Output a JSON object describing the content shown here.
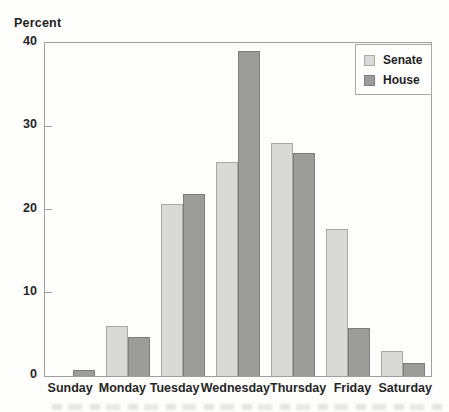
{
  "figure": {
    "ylabel": "Percent"
  },
  "chart_data": {
    "type": "bar",
    "title": "",
    "xlabel": "",
    "ylabel": "Percent",
    "categories": [
      "Sunday",
      "Monday",
      "Tuesday",
      "Wednesday",
      "Thursday",
      "Friday",
      "Saturday"
    ],
    "series": [
      {
        "name": "Senate",
        "color": "#d9d9d5",
        "border_color": "#a9a9a4",
        "values": [
          0,
          6.0,
          20.7,
          25.7,
          28.0,
          17.6,
          3.0
        ]
      },
      {
        "name": "House",
        "color": "#9c9c99",
        "border_color": "#7d7d81",
        "values": [
          0.7,
          4.7,
          21.9,
          39.0,
          26.8,
          5.8,
          1.6
        ]
      }
    ],
    "ylim": [
      0,
      40
    ],
    "yticks": [
      0,
      10,
      20,
      30,
      40
    ],
    "legend_position": "top-right",
    "grid": false,
    "frame_color": "#9f9f9d",
    "text_color": "#262626"
  }
}
